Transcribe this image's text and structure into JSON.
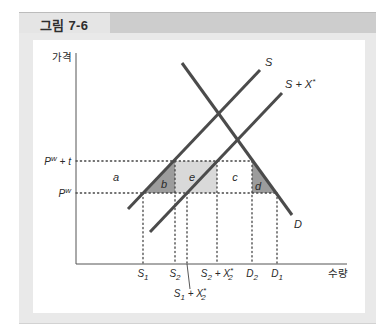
{
  "figure": {
    "title": "그림 7-6"
  },
  "chart_data": {
    "type": "line",
    "title": "그림 7-6",
    "xlabel": "수량",
    "ylabel": "가격",
    "grid": false,
    "legend": "none (lines labeled directly)",
    "units_note": "coordinates are relative chart units (origin at axes intersection)",
    "origin_px": [
      76,
      264
    ],
    "axes": {
      "x_max": 271,
      "y_max": 211,
      "color": "#555555"
    },
    "colors": {
      "curve": "#4b4b4b",
      "dotted": "#444444",
      "dark_region": "#9c9c9c",
      "light_region": "#d9d9d9"
    },
    "series": [
      {
        "name": "S",
        "points": [
          [
            52,
            55
          ],
          [
            184,
            194
          ]
        ],
        "label": [
          [
            "S",
            ""
          ]
        ],
        "label_pos": [
          189,
          198
        ],
        "label_anchor": "start"
      },
      {
        "name": "S+X*",
        "points": [
          [
            74,
            32
          ],
          [
            206,
            171
          ]
        ],
        "label": [
          [
            "S + X",
            ""
          ],
          [
            "*",
            "sup"
          ]
        ],
        "label_pos": [
          209,
          176
        ],
        "label_anchor": "start"
      },
      {
        "name": "D",
        "points": [
          [
            106,
            201
          ],
          [
            216,
            49
          ]
        ],
        "label": [
          [
            "D",
            ""
          ]
        ],
        "label_pos": [
          218,
          36
        ],
        "label_anchor": "start"
      }
    ],
    "y_ticks": [
      {
        "name": "P^w+t",
        "value": 103,
        "label": [
          [
            "P",
            ""
          ],
          [
            "w",
            "sup"
          ],
          [
            " + t",
            ""
          ]
        ]
      },
      {
        "name": "P^w",
        "value": 71,
        "label": [
          [
            "P",
            ""
          ],
          [
            "w",
            "sup"
          ]
        ]
      }
    ],
    "x_ticks": [
      {
        "name": "S1",
        "value": 67,
        "label": [
          [
            "S",
            ""
          ],
          [
            "1",
            "sub"
          ]
        ],
        "label_y": -13
      },
      {
        "name": "S2",
        "value": 99,
        "label": [
          [
            "S",
            ""
          ],
          [
            "2",
            "sub"
          ]
        ],
        "label_y": -13
      },
      {
        "name": "S1+X2*",
        "value": 111,
        "label": [
          [
            "S",
            ""
          ],
          [
            "1",
            "sub"
          ],
          [
            " + X",
            ""
          ],
          [
            "*",
            "sup"
          ],
          [
            "2",
            "substack"
          ]
        ],
        "label_y": -33,
        "label_x": 114,
        "leader": [
          [
            111,
            0
          ],
          [
            114,
            -25
          ]
        ]
      },
      {
        "name": "S2+X2*",
        "value": 141,
        "label": [
          [
            "S",
            ""
          ],
          [
            "2",
            "sub"
          ],
          [
            " + X",
            ""
          ],
          [
            "*",
            "sup"
          ],
          [
            "2",
            "substack"
          ]
        ],
        "label_y": -13
      },
      {
        "name": "D2",
        "value": 176,
        "label": [
          [
            "D",
            ""
          ],
          [
            "2",
            "sub"
          ]
        ],
        "label_y": -13
      },
      {
        "name": "D1",
        "value": 201,
        "label": [
          [
            "D",
            ""
          ],
          [
            "1",
            "sub"
          ]
        ],
        "label_y": -13
      }
    ],
    "dotted_lines": [
      {
        "name": "price-world-plus-tariff",
        "from": [
          0,
          103
        ],
        "to": [
          176,
          103
        ]
      },
      {
        "name": "price-world",
        "from": [
          0,
          71
        ],
        "to": [
          201,
          71
        ]
      },
      {
        "name": "S1",
        "from": [
          67,
          71
        ],
        "to": [
          67,
          0
        ]
      },
      {
        "name": "S2",
        "from": [
          99,
          103
        ],
        "to": [
          99,
          0
        ]
      },
      {
        "name": "S1+X2*",
        "from": [
          111,
          71
        ],
        "to": [
          111,
          0
        ]
      },
      {
        "name": "S2+X2*",
        "from": [
          141,
          103
        ],
        "to": [
          141,
          0
        ]
      },
      {
        "name": "D2",
        "from": [
          176,
          103
        ],
        "to": [
          176,
          0
        ]
      },
      {
        "name": "D1",
        "from": [
          201,
          71
        ],
        "to": [
          201,
          0
        ]
      }
    ],
    "regions": [
      {
        "label": "a",
        "shade": "none",
        "polygon": [],
        "label_pos": [
          40,
          83
        ]
      },
      {
        "label": "b",
        "shade": "dark",
        "polygon": [
          [
            67,
            71
          ],
          [
            99,
            103
          ],
          [
            99,
            71
          ]
        ],
        "label_pos": [
          88,
          76
        ]
      },
      {
        "label": "e",
        "shade": "light",
        "polygon": [
          [
            99,
            71
          ],
          [
            99,
            103
          ],
          [
            141,
            103
          ],
          [
            141,
            71
          ]
        ],
        "label_pos": [
          116,
          83
        ]
      },
      {
        "label": "c",
        "shade": "none",
        "polygon": [],
        "label_pos": [
          159,
          83
        ]
      },
      {
        "label": "d",
        "shade": "dark",
        "polygon": [
          [
            176,
            103
          ],
          [
            176,
            71
          ],
          [
            201,
            71
          ]
        ],
        "label_pos": [
          182,
          74
        ]
      }
    ],
    "axis_labels": {
      "y": {
        "text": "가격",
        "pos": [
          -4,
          203
        ]
      },
      "x": {
        "text": "수량",
        "pos": [
          272,
          -13
        ]
      }
    }
  }
}
